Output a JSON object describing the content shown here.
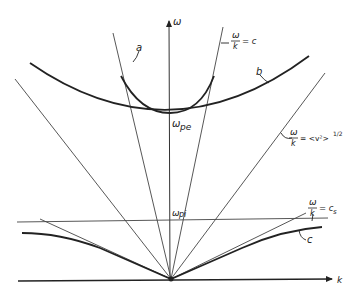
{
  "axes": {
    "y_label": "ω",
    "x_label": "k"
  },
  "curves": {
    "a_label": "a",
    "b_label": "b",
    "c_label": "c"
  },
  "annotations": {
    "light_line": {
      "num": "ω",
      "den": "k",
      "rhs": "= c"
    },
    "thermal_line": {
      "num": "ω",
      "den": "k",
      "rhs": "= <v²>",
      "exp": "1/2"
    },
    "sound_line": {
      "num": "ω",
      "den": "k",
      "rhs": "= c",
      "sub": "s"
    },
    "omega_pe": {
      "main": "ω",
      "sub": "pe"
    },
    "omega_pi": {
      "main": "ω",
      "sub": "pi"
    }
  },
  "colors": {
    "ink": "#222222",
    "thin": "#444444",
    "background": "#ffffff"
  }
}
